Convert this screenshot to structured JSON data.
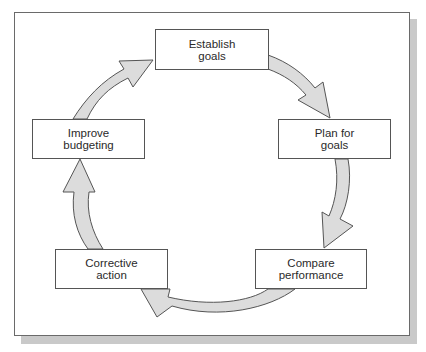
{
  "diagram": {
    "type": "cycle",
    "steps": [
      {
        "id": "establish",
        "line1": "Establish",
        "line2": "goals"
      },
      {
        "id": "plan",
        "line1": "Plan for",
        "line2": "goals"
      },
      {
        "id": "compare",
        "line1": "Compare",
        "line2": "performance"
      },
      {
        "id": "corrective",
        "line1": "Corrective",
        "line2": "action"
      },
      {
        "id": "improve",
        "line1": "Improve",
        "line2": "budgeting"
      }
    ],
    "flow": [
      {
        "from": "establish",
        "to": "plan"
      },
      {
        "from": "plan",
        "to": "compare"
      },
      {
        "from": "compare",
        "to": "corrective"
      },
      {
        "from": "corrective",
        "to": "improve"
      },
      {
        "from": "improve",
        "to": "establish"
      }
    ],
    "colors": {
      "arrow_fill": "#dcdcdc",
      "arrow_stroke": "#555555",
      "box_border": "#555555",
      "text": "#2a2a2a",
      "shadow": "#c9c9c9"
    }
  }
}
